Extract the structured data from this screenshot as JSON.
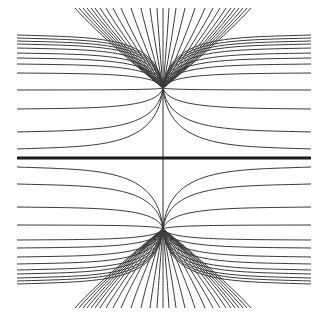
{
  "figure": {
    "width": 321,
    "height": 324,
    "stroke_color": "#3a3a3a",
    "axis_color": "#1a1a1a",
    "background": "#ffffff",
    "center_x": 163,
    "axis_y": 158,
    "axis_x_range": [
      17,
      311
    ],
    "vertical_line_y_range": [
      88,
      229
    ],
    "foci": [
      {
        "name": "upper-focus",
        "x": 163,
        "y": 88
      },
      {
        "name": "lower-focus",
        "x": 163,
        "y": 229
      }
    ],
    "upper_fan": {
      "end_y": 8,
      "end_x_offsets": [
        -88,
        -84,
        -80,
        -76,
        -72,
        -68,
        -63,
        -57,
        -50,
        -42,
        -32,
        -22,
        -13,
        -6,
        0,
        6,
        13,
        22,
        32,
        42,
        50,
        57,
        63,
        68,
        72,
        76,
        80,
        84,
        88
      ]
    },
    "lower_fan": {
      "end_y": 308,
      "end_x_offsets": [
        -88,
        -84,
        -80,
        -76,
        -72,
        -68,
        -63,
        -57,
        -50,
        -42,
        -32,
        -22,
        -13,
        -6,
        0,
        6,
        13,
        22,
        32,
        42,
        50,
        57,
        63,
        68,
        72,
        76,
        80,
        84,
        88
      ]
    },
    "side_curves": {
      "left_x": 17,
      "right_x": 311,
      "upper_end_y": [
        35,
        38,
        41,
        44,
        48,
        53,
        58,
        64,
        73,
        90,
        109,
        132,
        149
      ],
      "lower_end_y": [
        167,
        184,
        207,
        225,
        240,
        248,
        257,
        264,
        270,
        274,
        278,
        281,
        284
      ]
    }
  }
}
